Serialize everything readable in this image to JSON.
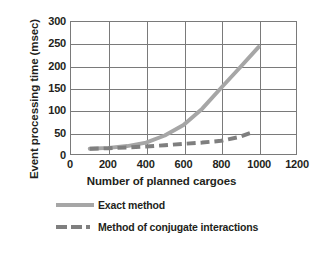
{
  "chart_data": {
    "type": "line",
    "title": "",
    "xlabel": "Number of planned cargoes",
    "ylabel": "Event processing time (msec)",
    "xlim": [
      0,
      1200
    ],
    "ylim": [
      0,
      300
    ],
    "xticks": [
      0,
      200,
      400,
      600,
      800,
      1000,
      1200
    ],
    "yticks": [
      0,
      50,
      100,
      150,
      200,
      250,
      300
    ],
    "grid": true,
    "legend_position": "bottom",
    "series": [
      {
        "name": "Exact method",
        "style": "solid",
        "color": "#a6a6a6",
        "x": [
          100,
          200,
          300,
          400,
          500,
          600,
          700,
          800,
          900,
          1000
        ],
        "values": [
          12,
          14,
          18,
          26,
          42,
          66,
          103,
          150,
          196,
          243
        ]
      },
      {
        "name": "Method of conjugate interactions",
        "style": "dashed",
        "color": "#7f7f7f",
        "x": [
          100,
          200,
          300,
          400,
          500,
          600,
          700,
          800,
          900,
          970
        ],
        "values": [
          12,
          13,
          15,
          17,
          20,
          23,
          26,
          30,
          39,
          50
        ]
      }
    ]
  },
  "axes": {
    "ytick_labels": [
      "300",
      "250",
      "200",
      "150",
      "100",
      "50",
      "0"
    ],
    "xtick_labels": [
      "0",
      "200",
      "400",
      "600",
      "800",
      "1000",
      "1200"
    ]
  },
  "legend": {
    "items": [
      {
        "label": "Exact method",
        "swatch": "solid-line-swatch"
      },
      {
        "label": "Method of conjugate interactions",
        "swatch": "dashed-line-swatch"
      }
    ]
  },
  "colors": {
    "axis": "#7a7a7a",
    "text": "#231f20",
    "exact_method": "#a6a6a6",
    "conjugate_method": "#7f7f7f",
    "background": "#ffffff"
  }
}
